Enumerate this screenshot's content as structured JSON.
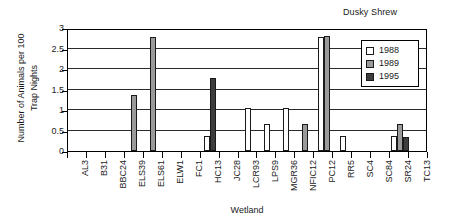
{
  "chart_data": {
    "type": "bar",
    "title": "Dusky Shrew",
    "xlabel": "Wetland",
    "ylabel_line1": "Number of Animals per 100",
    "ylabel_line2": "Trap Nights",
    "ylim": [
      0,
      3
    ],
    "yticks": [
      0,
      0.5,
      1,
      1.5,
      2,
      2.5,
      3
    ],
    "ytick_labels": [
      "0",
      "0.5",
      "1",
      "1.5",
      "2",
      "2.5",
      "3"
    ],
    "grid": true,
    "legend_position": "top-right",
    "categories": [
      "AL3",
      "B31",
      "BBC24",
      "ELS39",
      "ELS61",
      "ELW1",
      "FC1",
      "HC13",
      "JC28",
      "LCR93",
      "LPS9",
      "MGR36",
      "NFIC12",
      "PC12",
      "RR5",
      "SC4",
      "SC84",
      "SR24",
      "TC13"
    ],
    "series": [
      {
        "name": "1988",
        "color": "#ffffff",
        "values": [
          0,
          0,
          0,
          0,
          0,
          0,
          0,
          0.37,
          0,
          1.05,
          0.65,
          1.05,
          0,
          2.77,
          0.37,
          0,
          0,
          0.37,
          0
        ]
      },
      {
        "name": "1989",
        "color": "#9a9a9a",
        "values": [
          0,
          0,
          0,
          1.36,
          2.79,
          0,
          0,
          0,
          0,
          0,
          0,
          0,
          0.66,
          2.81,
          0,
          0,
          0,
          0.66,
          0
        ]
      },
      {
        "name": "1995",
        "color": "#3d3d3d",
        "values": [
          0,
          0,
          0,
          0,
          0,
          0,
          0,
          1.79,
          0,
          0,
          0,
          0,
          0,
          0,
          0,
          0,
          0,
          0.35,
          0
        ]
      }
    ]
  }
}
